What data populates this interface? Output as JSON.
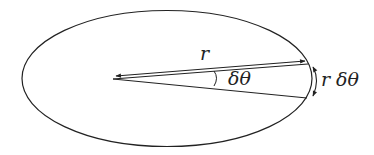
{
  "diagram": {
    "type": "ellipse-orbit-geometry",
    "labels": {
      "radius": "r",
      "angle": "δθ",
      "arc_length": "r δθ"
    },
    "colors": {
      "stroke": "#222222",
      "background": "#ffffff"
    }
  }
}
